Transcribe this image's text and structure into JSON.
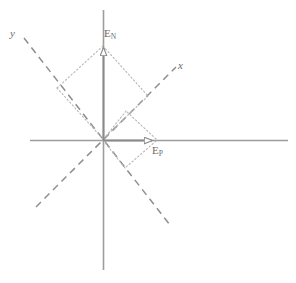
{
  "figure": {
    "type": "vector-decomposition-diagram",
    "width": 296,
    "height": 283,
    "background_color": "#ffffff"
  },
  "labels": {
    "e_n": {
      "base": "E",
      "sub": "N",
      "full": "EN",
      "x": 104,
      "y": 28,
      "style": "roman"
    },
    "e_p": {
      "base": "E",
      "sub": "P",
      "full": "EP",
      "x": 152,
      "y": 145,
      "style": "roman"
    },
    "axis_x": {
      "text": "x",
      "x": 178,
      "y": 60,
      "style": "italic"
    },
    "axis_y": {
      "text": "y",
      "x": 10,
      "y": 28,
      "style": "italic"
    }
  },
  "colors": {
    "axis": "#9a9a9a",
    "vector": "#8a8a8a",
    "dashed": "#8f8f8f",
    "dotted": "#b4b4b4",
    "text": "#6b6b6b",
    "background": "#ffffff"
  },
  "geometry": {
    "origin": {
      "x": 103,
      "y": 140
    },
    "reference_axes": {
      "horizontal": {
        "x1": 30,
        "y1": 140,
        "x2": 288,
        "y2": 140
      },
      "vertical": {
        "x1": 103,
        "y1": 10,
        "x2": 103,
        "y2": 270
      }
    },
    "rotated_axes": {
      "x_axis": {
        "x1": 40,
        "y1": 203,
        "x2": 178,
        "y2": 65,
        "angle_deg": -45,
        "dashed": true
      },
      "y_axis": {
        "x1": 24,
        "y1": 38,
        "x2": 168,
        "y2": 222,
        "angle_deg": 52,
        "dashed": true
      }
    },
    "vectors": [
      {
        "name": "E_N",
        "from": {
          "x": 103,
          "y": 140
        },
        "to": {
          "x": 103,
          "y": 45
        },
        "arrow": true
      },
      {
        "name": "E_P",
        "from": {
          "x": 103,
          "y": 140
        },
        "to": {
          "x": 155,
          "y": 140
        },
        "arrow": true
      }
    ],
    "construction_dotted": {
      "en_parallelogram": [
        {
          "x1": 103,
          "y1": 45,
          "x2": 58,
          "y2": 88
        },
        {
          "x1": 58,
          "y1": 88,
          "x2": 103,
          "y2": 140
        },
        {
          "x1": 103,
          "y1": 45,
          "x2": 147,
          "y2": 95
        },
        {
          "x1": 147,
          "y1": 95,
          "x2": 103,
          "y2": 140
        }
      ],
      "ep_parallelogram": [
        {
          "x1": 155,
          "y1": 140,
          "x2": 125,
          "y2": 112
        },
        {
          "x1": 125,
          "y1": 112,
          "x2": 103,
          "y2": 140
        },
        {
          "x1": 155,
          "y1": 140,
          "x2": 124,
          "y2": 167
        },
        {
          "x1": 124,
          "y1": 167,
          "x2": 103,
          "y2": 140
        }
      ]
    }
  }
}
